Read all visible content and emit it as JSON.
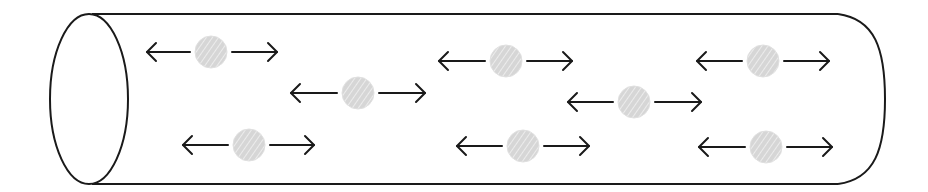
{
  "diagram": {
    "colors": {
      "outline": "#1a1a1a",
      "particle_fill": "#d6d6d6",
      "particle_hatch": "#f2f2f2",
      "arrow": "#1a1a1a",
      "background": "#ffffff"
    },
    "cylinder": {
      "left_ellipse": {
        "cx": 89,
        "cy": 99,
        "rx": 39,
        "ry": 85
      },
      "top_y": 14,
      "bottom_y": 184,
      "body_start_x": 92,
      "body_end_x": 838,
      "right_cap_max_x": 885
    },
    "particles": [
      {
        "id": "p1",
        "cx": 211,
        "cy": 52,
        "r": 16,
        "left_tip": 147,
        "right_tip": 277
      },
      {
        "id": "p2",
        "cx": 358,
        "cy": 93,
        "r": 16,
        "left_tip": 291,
        "right_tip": 425
      },
      {
        "id": "p3",
        "cx": 506,
        "cy": 61,
        "r": 16,
        "left_tip": 439,
        "right_tip": 572
      },
      {
        "id": "p4",
        "cx": 634,
        "cy": 102,
        "r": 16,
        "left_tip": 568,
        "right_tip": 701
      },
      {
        "id": "p5",
        "cx": 763,
        "cy": 61,
        "r": 16,
        "left_tip": 697,
        "right_tip": 829
      },
      {
        "id": "p6",
        "cx": 249,
        "cy": 145,
        "r": 16,
        "left_tip": 183,
        "right_tip": 314
      },
      {
        "id": "p7",
        "cx": 523,
        "cy": 146,
        "r": 16,
        "left_tip": 457,
        "right_tip": 589
      },
      {
        "id": "p8",
        "cx": 766,
        "cy": 147,
        "r": 16,
        "left_tip": 699,
        "right_tip": 832
      }
    ]
  }
}
